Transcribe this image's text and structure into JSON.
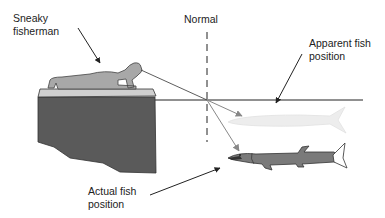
{
  "labels": {
    "fisherman": [
      "Sneaky",
      "fisherman"
    ],
    "normal": "Normal",
    "apparent": [
      "Apparent fish",
      "position"
    ],
    "actual": [
      "Actual fish",
      "position"
    ]
  },
  "colors": {
    "dock": "#5a5a5a",
    "dock_top": "#c8c8c8",
    "person": "#a8a8a8",
    "fish": "#7a7a7a",
    "fish_ghost": "#e6e6e6",
    "ray": "#888888",
    "line": "#222222"
  }
}
